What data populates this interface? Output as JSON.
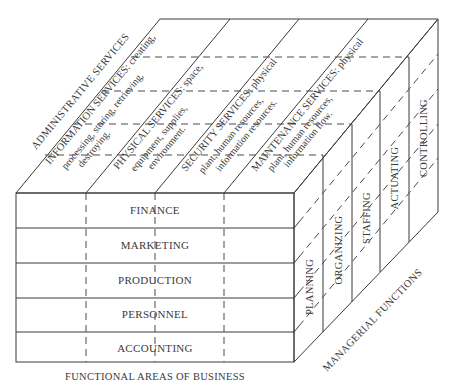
{
  "diagram": {
    "type": "three-dimensional cube matrix",
    "front_face": {
      "axis_label": "FUNCTIONAL AREAS OF BUSINESS",
      "rows": [
        "FINANCE",
        "MARKETING",
        "PRODUCTION",
        "PERSONNEL",
        "ACCOUNTING"
      ]
    },
    "top_face": {
      "axis_label": "ADMINISTRATIVE SERVICES",
      "columns": [
        {
          "line1": "INFORMATION SERVICES: creating,",
          "line2": "processing, storing, retrieving,",
          "line3": "destroying."
        },
        {
          "line1": "PHYSICAL SERVICES: space,",
          "line2": "equipment, supplies,",
          "line3": "environment."
        },
        {
          "line1": "SECURITY SERVICES: physical",
          "line2": "plant, human resources,",
          "line3": "information resources."
        },
        {
          "line1": "MAINTENANCE SERVICES: physical",
          "line2": "plant, human resources,",
          "line3": "information flow."
        }
      ]
    },
    "right_face": {
      "axis_label": "MANAGERIAL FUNCTIONS",
      "layers": [
        "PLANNING",
        "ORGANIZING",
        "STAFFING",
        "ACTUATING",
        "CONTROLLING"
      ]
    }
  }
}
